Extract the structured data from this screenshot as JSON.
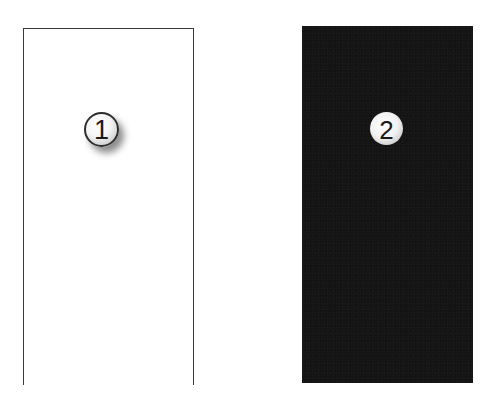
{
  "figure": {
    "panels": [
      {
        "id": 1,
        "style": "open-bottom outline",
        "fill_color": "#ffffff",
        "stroke_color": "#3a3a3a",
        "badge": {
          "label": "1",
          "style": "sphere with drop shadow"
        }
      },
      {
        "id": 2,
        "style": "solid filled",
        "fill_color": "#151515",
        "badge": {
          "label": "2",
          "style": "sphere"
        }
      }
    ]
  }
}
